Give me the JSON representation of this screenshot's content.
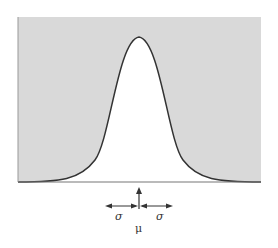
{
  "diagram": {
    "title": "",
    "type": "normal distribution curve",
    "labels": {
      "sigma_left": "σ",
      "sigma_right": "σ",
      "mu": "μ"
    },
    "colors": {
      "background_fill": "#d9d9d9",
      "under_curve": "#ffffff",
      "curve": "#333333",
      "baseline": "#666666"
    }
  }
}
